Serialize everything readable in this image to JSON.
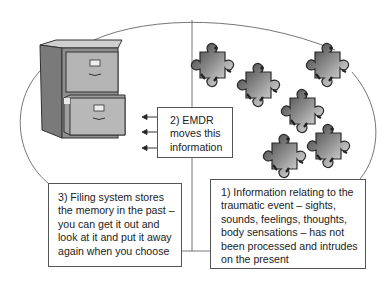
{
  "diagram": {
    "type": "concept-diagram",
    "regions": {
      "left": {
        "label": "past / processed memory",
        "icon": "filing-cabinet-icon"
      },
      "right": {
        "label": "present / unprocessed trauma",
        "icon": "puzzle-piece-icon",
        "count": 6
      }
    },
    "boxes": {
      "emdr": {
        "lines": [
          "2) EMDR",
          "moves this",
          "information"
        ]
      },
      "filing": {
        "lines": [
          "3) Filing system stores",
          "the memory in the past –",
          "you can get it out and",
          "look at it and put it away",
          "again when you choose"
        ]
      },
      "info": {
        "lines": [
          "1) Information relating to the",
          "traumatic event – sights,",
          "sounds, feelings, thoughts,",
          "body sensations – has not",
          "been processed and intrudes",
          "on the present"
        ]
      }
    },
    "arrows": {
      "count": 3,
      "direction": "left"
    },
    "colors": {
      "line": "#555555",
      "cabinet_side": "#7a7a7a",
      "cabinet_front": "#a9a9a9",
      "puzzle_dark": "#3a3a3a",
      "puzzle_light": "#e6e6e6"
    }
  }
}
